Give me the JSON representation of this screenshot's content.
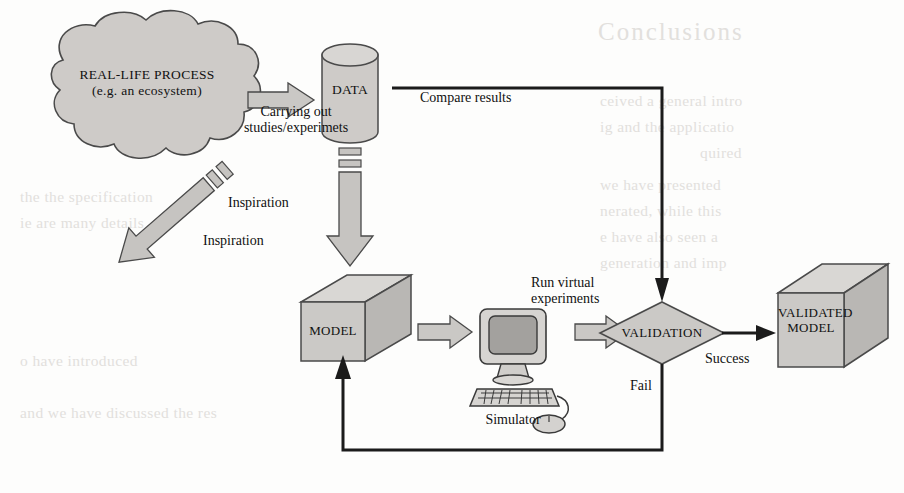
{
  "diagram": {
    "nodes": {
      "real_life_process": {
        "line1": "REAL-LIFE PROCESS",
        "line2": "(e.g. an ecosystem)",
        "shape": "cloud"
      },
      "data": {
        "label": "DATA",
        "shape": "cylinder"
      },
      "model": {
        "label": "MODEL",
        "shape": "cube"
      },
      "simulator": {
        "label": "Simulator",
        "shape": "computer"
      },
      "validation": {
        "label": "VALIDATION",
        "shape": "diamond"
      },
      "validated_model": {
        "line1": "VALIDATED",
        "line2": "MODEL",
        "shape": "cube"
      }
    },
    "edges": {
      "carrying_out": {
        "line1": "Carrying out",
        "line2": "studies/experimets",
        "style": "block-arrow"
      },
      "inspiration_cloud": {
        "label": "Inspiration",
        "style": "dashed-block-arrow"
      },
      "inspiration_data": {
        "label": "Inspiration",
        "style": "dashed-block-arrow"
      },
      "run_virtual": {
        "line1": "Run virtual",
        "line2": "experiments",
        "style": "block-arrow"
      },
      "compare_results": {
        "label": "Compare results",
        "style": "line-arrow"
      },
      "success": {
        "label": "Success",
        "style": "line-arrow"
      },
      "fail": {
        "label": "Fail",
        "style": "line-arrow"
      }
    },
    "colors": {
      "fill_light": "#d4d2cf",
      "fill_mid": "#c0bebb",
      "fill_dark": "#a9a7a4",
      "stroke": "#3a3a3a",
      "text": "#111111",
      "ghost": "#e2e0dd"
    }
  },
  "background_ghost_text": {
    "heading": "Conclusions",
    "lines": [
      "ceived a general intro",
      "ig and the applicatio",
      "quired",
      "we have presented",
      "nerated, while this",
      "e have also seen a",
      "generation and imp",
      "the the specification",
      "ie are many details",
      "o have introduced",
      "and we have discussed the res"
    ]
  }
}
